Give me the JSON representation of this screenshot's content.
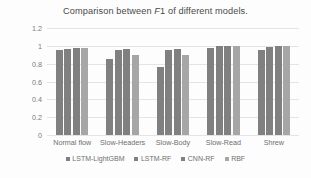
{
  "chart_data": {
    "type": "bar",
    "title": "Comparison between F1 of different models.",
    "title_parts": {
      "before": "Comparison between ",
      "italic": "F",
      "after": "1 of different models."
    },
    "xlabel": "",
    "ylabel": "",
    "ylim": [
      0,
      1.2
    ],
    "grid": true,
    "legend_position": "bottom",
    "ytick_labels": [
      "1.2",
      "1",
      "0.8",
      "0.6",
      "0.4",
      "0.2",
      "0"
    ],
    "ytick_values": [
      1.2,
      1,
      0.8,
      0.6,
      0.4,
      0.2,
      0
    ],
    "categories": [
      "Normal flow",
      "Slow-Headers",
      "Slow-Body",
      "Slow-Read",
      "Shrew"
    ],
    "series": [
      {
        "name": "LSTM-LightGBM",
        "color": "#808080",
        "values": [
          0.95,
          0.85,
          0.76,
          0.98,
          0.95
        ]
      },
      {
        "name": "LSTM-RF",
        "color": "#808080",
        "values": [
          0.96,
          0.95,
          0.95,
          1.0,
          0.99
        ]
      },
      {
        "name": "CNN-RF",
        "color": "#808080",
        "values": [
          0.98,
          0.96,
          0.97,
          1.0,
          1.0
        ]
      },
      {
        "name": "RBF",
        "color": "#a6a6a6",
        "values": [
          0.98,
          0.9,
          0.9,
          1.0,
          1.0
        ]
      }
    ]
  }
}
